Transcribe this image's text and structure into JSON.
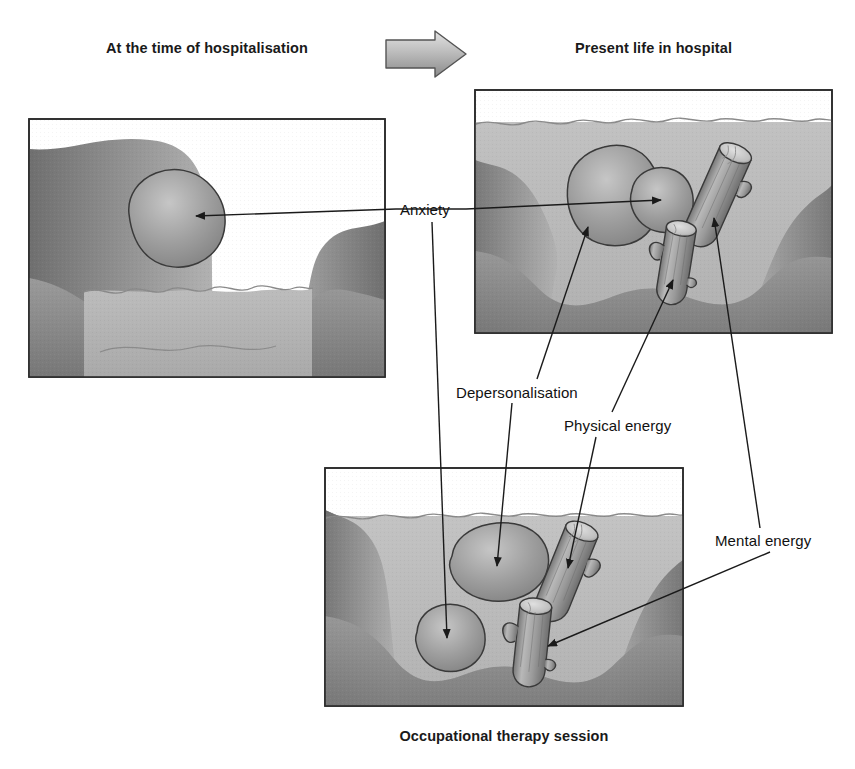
{
  "figure": {
    "type": "conceptual-diagram",
    "background_color": "#ffffff",
    "line_color": "#1a1a1a"
  },
  "titles": {
    "left": "At the time of hospitalisation",
    "right": "Present life in hospital",
    "bottom": "Occupational therapy session"
  },
  "transition_arrow": {
    "icon": "right-arrow-icon",
    "fill_start": "#d8d8d8",
    "fill_end": "#8f8f8f",
    "stroke": "#4a4a4a"
  },
  "labels": [
    {
      "id": "anxiety",
      "text": "Anxiety"
    },
    {
      "id": "depersonalisation",
      "text": "Depersonalisation"
    },
    {
      "id": "physical-energy",
      "text": "Physical energy"
    },
    {
      "id": "mental-energy",
      "text": "Mental energy"
    }
  ],
  "panels": [
    {
      "id": "hospitalisation",
      "title": "At the time of hospitalisation",
      "water_level": "low",
      "objects": [
        {
          "kind": "blob",
          "label": "Anxiety",
          "state": "above-water"
        }
      ]
    },
    {
      "id": "present-life",
      "title": "Present life in hospital",
      "water_level": "high",
      "objects": [
        {
          "kind": "blob",
          "label": "Depersonalisation",
          "state": "submerged"
        },
        {
          "kind": "blob",
          "label": "Anxiety",
          "state": "submerged"
        },
        {
          "kind": "log",
          "label": "Mental energy",
          "state": "submerged"
        },
        {
          "kind": "log",
          "label": "Physical energy",
          "state": "submerged"
        }
      ]
    },
    {
      "id": "occupational-therapy",
      "title": "Occupational therapy session",
      "water_level": "medium",
      "objects": [
        {
          "kind": "blob",
          "label": "Depersonalisation",
          "state": "submerged"
        },
        {
          "kind": "blob",
          "label": "Anxiety",
          "state": "submerged"
        },
        {
          "kind": "log",
          "label": "Physical energy",
          "state": "submerged"
        },
        {
          "kind": "log",
          "label": "Mental energy",
          "state": "submerged"
        }
      ]
    }
  ],
  "colors": {
    "water": "#b3b3b3",
    "water_dark": "#a3a3a3",
    "bank_light": "#a8a8a8",
    "bank_dark": "#7d7d7d",
    "object_fill": "#949494",
    "object_fill_light": "#bdbdbd",
    "panel_border": "#2b2b2b",
    "panel_bg": "#ffffff"
  }
}
